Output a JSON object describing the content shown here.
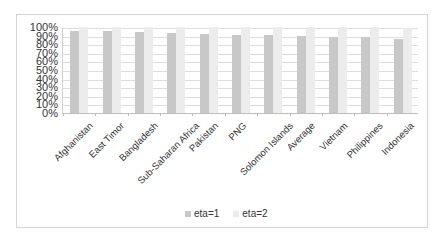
{
  "chart_data": {
    "type": "bar",
    "title": "",
    "xlabel": "",
    "ylabel": "",
    "ylim": [
      0,
      100
    ],
    "y_ticks": [
      "0%",
      "10%",
      "20%",
      "30%",
      "40%",
      "50%",
      "60%",
      "70%",
      "80%",
      "90%",
      "100%"
    ],
    "grid": true,
    "legend_position": "bottom",
    "categories": [
      "Afghanistan",
      "East Timor",
      "Bangladesh",
      "Sub-Saharan Africa",
      "Pakistan",
      "PNG",
      "Solomon Islands",
      "Average",
      "Vietnam",
      "Philippines",
      "Indonesia"
    ],
    "series": [
      {
        "name": "eta=1",
        "color": "#c8c8c8",
        "values": [
          95,
          95,
          94,
          93,
          92,
          91,
          91,
          90,
          88,
          88,
          86
        ]
      },
      {
        "name": "eta=2",
        "color": "#ececec",
        "values": [
          100,
          100,
          100,
          100,
          100,
          100,
          100,
          100,
          100,
          100,
          99
        ]
      }
    ]
  },
  "legend": {
    "items": [
      {
        "label": "eta=1",
        "color": "#c8c8c8"
      },
      {
        "label": "eta=2",
        "color": "#ececec"
      }
    ]
  }
}
